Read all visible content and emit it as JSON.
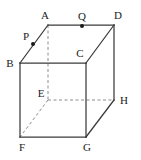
{
  "figure": {
    "kind": "cube-diagram",
    "caption": "Cube with vertices A-H and marked points P and Q",
    "canvas": {
      "width": 141,
      "height": 160
    },
    "colors": {
      "background": "#ffffff",
      "solid_edge": "#3a3a3a",
      "hidden_edge": "#8c8c8c",
      "label_text": "#1a1a1a",
      "marker_dot": "#1a1a1a"
    },
    "vertices": [
      {
        "id": "A",
        "label": "A",
        "x": 48,
        "y": 25,
        "hidden": false,
        "label_x": 45,
        "label_y": 19
      },
      {
        "id": "D",
        "label": "D",
        "x": 114,
        "y": 25,
        "hidden": false,
        "label_x": 118,
        "label_y": 19
      },
      {
        "id": "B",
        "label": "B",
        "x": 20,
        "y": 63,
        "hidden": false,
        "label_x": 10,
        "label_y": 67
      },
      {
        "id": "C",
        "label": "C",
        "x": 86,
        "y": 63,
        "hidden": false,
        "label_x": 80,
        "label_y": 57
      },
      {
        "id": "E",
        "label": "E",
        "x": 48,
        "y": 100,
        "hidden": true,
        "label_x": 41,
        "label_y": 97
      },
      {
        "id": "H",
        "label": "H",
        "x": 114,
        "y": 100,
        "hidden": false,
        "label_x": 124,
        "label_y": 104
      },
      {
        "id": "F",
        "label": "F",
        "x": 20,
        "y": 137,
        "hidden": false,
        "label_x": 22,
        "label_y": 151
      },
      {
        "id": "G",
        "label": "G",
        "x": 86,
        "y": 137,
        "hidden": false,
        "label_x": 87,
        "label_y": 151
      }
    ],
    "solid_edges": [
      {
        "id": "edge-A-D",
        "from": "A",
        "to": "D"
      },
      {
        "id": "edge-A-B",
        "from": "A",
        "to": "B"
      },
      {
        "id": "edge-D-C",
        "from": "D",
        "to": "C"
      },
      {
        "id": "edge-D-H",
        "from": "D",
        "to": "H"
      },
      {
        "id": "edge-B-C",
        "from": "B",
        "to": "C"
      },
      {
        "id": "edge-B-F",
        "from": "B",
        "to": "F"
      },
      {
        "id": "edge-C-G",
        "from": "C",
        "to": "G"
      },
      {
        "id": "edge-F-G",
        "from": "F",
        "to": "G"
      },
      {
        "id": "edge-G-H",
        "from": "G",
        "to": "H"
      }
    ],
    "hidden_edges": [
      {
        "id": "edge-A-E",
        "from": "A",
        "to": "E"
      },
      {
        "id": "edge-E-H",
        "from": "E",
        "to": "H"
      },
      {
        "id": "edge-E-F",
        "from": "E",
        "to": "F"
      }
    ],
    "points": [
      {
        "id": "P",
        "label": "P",
        "x": 33,
        "y": 44,
        "on_edge": "edge-A-B",
        "label_x": 26,
        "label_y": 40,
        "radius": 2
      },
      {
        "id": "Q",
        "label": "Q",
        "x": 82,
        "y": 26,
        "on_edge": "edge-A-D",
        "label_x": 82,
        "label_y": 20,
        "radius": 2
      }
    ]
  }
}
